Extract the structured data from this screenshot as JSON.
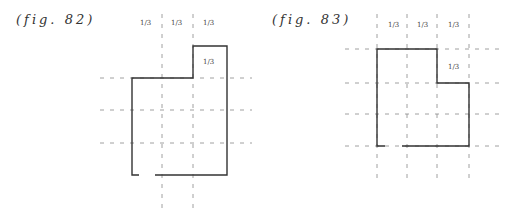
{
  "figures": [
    {
      "caption": "(fig. 82)",
      "top_labels": [
        "1/3",
        "1/3",
        "1/3"
      ],
      "inner_label": "1/3"
    },
    {
      "caption": "(fig. 83)",
      "top_labels": [
        "1/3",
        "1/3",
        "1/3"
      ],
      "inner_label": "1/3"
    }
  ],
  "colors": {
    "outline": "#333333",
    "dashed": "#777777",
    "background": "#ffffff"
  }
}
